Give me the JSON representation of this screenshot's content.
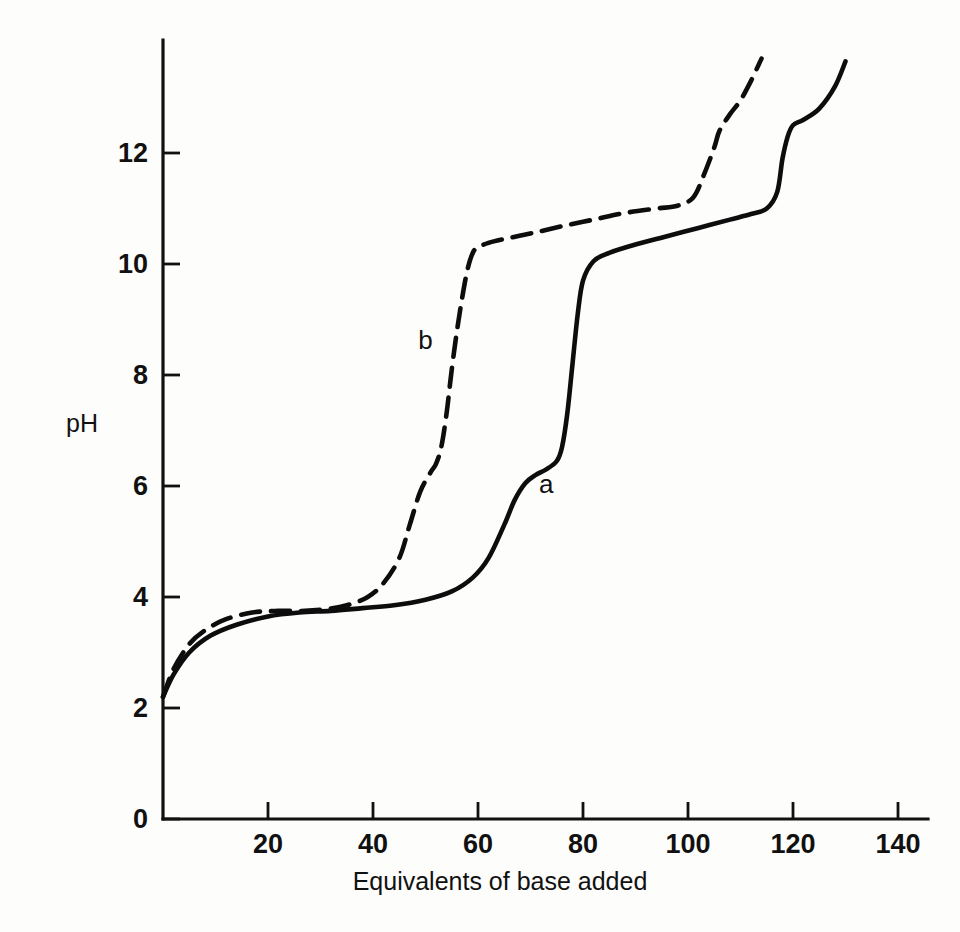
{
  "figure": {
    "background_color": "#fdfdfc",
    "line_color": "#0d0d0d"
  },
  "axes": {
    "x_title": "Equivalents of base added",
    "y_title": "pH",
    "x_ticks": [
      "20",
      "40",
      "60",
      "80",
      "100",
      "120",
      "140"
    ],
    "y_ticks": [
      "0",
      "2",
      "4",
      "6",
      "8",
      "10",
      "12"
    ]
  },
  "labels": {
    "curve_a": "a",
    "curve_b": "b"
  },
  "chart_data": {
    "type": "line",
    "title": "",
    "xlabel": "Equivalents of base added",
    "ylabel": "pH",
    "xlim": [
      0,
      143
    ],
    "ylim": [
      0,
      13.6
    ],
    "xticks": [
      20,
      40,
      60,
      80,
      100,
      120,
      140
    ],
    "yticks": [
      0,
      2,
      4,
      6,
      8,
      10,
      12
    ],
    "grid": false,
    "legend": "inline-labels",
    "series": [
      {
        "name": "a",
        "style": "solid",
        "label": "a",
        "label_at": [
          73,
          6.0
        ],
        "x": [
          0,
          2,
          5,
          9,
          14,
          20,
          26,
          32,
          38,
          44,
          50,
          55,
          59,
          62,
          65,
          67,
          69,
          71,
          73,
          75,
          76,
          77,
          78,
          79,
          80,
          82,
          85,
          90,
          96,
          102,
          108,
          112,
          115,
          117,
          118,
          119,
          120,
          122,
          125,
          128,
          130
        ],
        "y": [
          2.2,
          2.6,
          3.0,
          3.3,
          3.5,
          3.65,
          3.72,
          3.75,
          3.8,
          3.85,
          3.95,
          4.1,
          4.35,
          4.7,
          5.3,
          5.75,
          6.05,
          6.2,
          6.3,
          6.45,
          6.7,
          7.3,
          8.2,
          9.1,
          9.7,
          10.05,
          10.2,
          10.35,
          10.5,
          10.65,
          10.8,
          10.9,
          11.0,
          11.3,
          11.9,
          12.3,
          12.5,
          12.6,
          12.8,
          13.2,
          13.65
        ]
      },
      {
        "name": "b",
        "style": "dashed",
        "label": "b",
        "label_at": [
          50,
          8.6
        ],
        "x": [
          0,
          2,
          5,
          8,
          12,
          17,
          22,
          27,
          31,
          35,
          39,
          42,
          45,
          47,
          49,
          51,
          52,
          53,
          54,
          55,
          56,
          57,
          58,
          59,
          60,
          62,
          65,
          70,
          76,
          82,
          88,
          94,
          98,
          101,
          103,
          105,
          106,
          108,
          110,
          112,
          114
        ],
        "y": [
          2.2,
          2.7,
          3.15,
          3.4,
          3.6,
          3.72,
          3.75,
          3.75,
          3.78,
          3.85,
          4.0,
          4.25,
          4.7,
          5.3,
          5.9,
          6.25,
          6.4,
          6.7,
          7.3,
          8.1,
          8.8,
          9.4,
          9.9,
          10.2,
          10.3,
          10.38,
          10.45,
          10.55,
          10.68,
          10.8,
          10.92,
          11.0,
          11.05,
          11.2,
          11.6,
          12.1,
          12.4,
          12.7,
          12.95,
          13.3,
          13.7
        ]
      }
    ]
  }
}
